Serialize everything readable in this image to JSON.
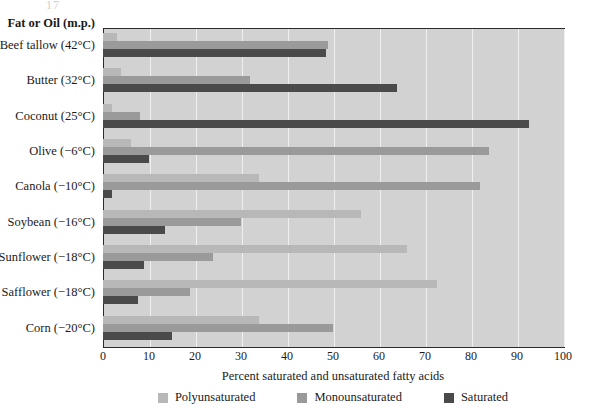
{
  "page_artifact": "17",
  "header": {
    "category_axis_title": "Fat or Oil (m.p.)"
  },
  "chart_data": {
    "type": "bar",
    "orientation": "horizontal",
    "grouped": true,
    "title": "",
    "subtitle": "",
    "xlabel": "Percent saturated and unsaturated fatty acids",
    "ylabel": "Fat or Oil (m.p.)",
    "xlim": [
      0,
      100
    ],
    "xticks": [
      0,
      10,
      20,
      30,
      40,
      50,
      60,
      70,
      80,
      90,
      100
    ],
    "xtick_labels": [
      "0",
      "10",
      "20",
      "30",
      "40",
      "50",
      "60",
      "70",
      "80",
      "90",
      "100"
    ],
    "grid": "vertical",
    "legend_position": "bottom",
    "categories": [
      "Beef tallow (42°C)",
      "Butter (32°C)",
      "Coconut (25°C)",
      "Olive (−6°C)",
      "Canola (−10°C)",
      "Soybean (−16°C)",
      "Sunflower (−18°C)",
      "Safflower (−18°C)",
      "Corn (−20°C)"
    ],
    "series": [
      {
        "name": "Polyunsaturated",
        "color": "#b8b8b8",
        "values": [
          3,
          4,
          2,
          6,
          34,
          56,
          66,
          72.5,
          34
        ]
      },
      {
        "name": "Monounsaturated",
        "color": "#9a9a9a",
        "values": [
          49,
          32,
          8,
          84,
          82,
          30,
          24,
          19,
          50
        ]
      },
      {
        "name": "Saturated",
        "color": "#4a4a4a",
        "values": [
          48.5,
          64,
          92.5,
          10,
          2,
          13.5,
          9,
          7.5,
          15
        ]
      }
    ]
  },
  "legend": {
    "items": [
      {
        "label": "Polyunsaturated",
        "color": "#b8b8b8"
      },
      {
        "label": "Monounsaturated",
        "color": "#9a9a9a"
      },
      {
        "label": "Saturated",
        "color": "#4a4a4a"
      }
    ]
  },
  "colors": {
    "plot_background": "#d2d2d2",
    "gridline": "#efefef",
    "axis_border": "#2b2b2b",
    "text": "#1a1a1a"
  }
}
